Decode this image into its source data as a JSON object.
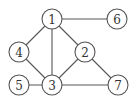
{
  "diagram": {
    "type": "undirected-graph",
    "node_radius": 10,
    "colors": {
      "stroke": "#555555",
      "fill": "#ffffff",
      "text": "#333333"
    },
    "nodes": [
      {
        "id": "1",
        "label": "1",
        "x": 52,
        "y": 19
      },
      {
        "id": "6",
        "label": "6",
        "x": 117,
        "y": 19
      },
      {
        "id": "4",
        "label": "4",
        "x": 19,
        "y": 52
      },
      {
        "id": "2",
        "label": "2",
        "x": 85,
        "y": 52
      },
      {
        "id": "5",
        "label": "5",
        "x": 19,
        "y": 85
      },
      {
        "id": "3",
        "label": "3",
        "x": 52,
        "y": 85
      },
      {
        "id": "7",
        "label": "7",
        "x": 118,
        "y": 85
      }
    ],
    "edges": [
      {
        "from": "1",
        "to": "6"
      },
      {
        "from": "1",
        "to": "4"
      },
      {
        "from": "1",
        "to": "3"
      },
      {
        "from": "1",
        "to": "2"
      },
      {
        "from": "4",
        "to": "3"
      },
      {
        "from": "2",
        "to": "3"
      },
      {
        "from": "2",
        "to": "7"
      },
      {
        "from": "5",
        "to": "3"
      },
      {
        "from": "3",
        "to": "7"
      }
    ]
  }
}
